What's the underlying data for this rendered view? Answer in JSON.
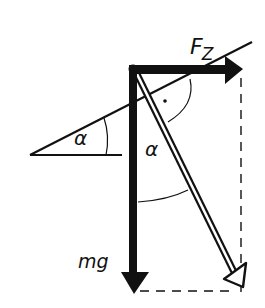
{
  "labels": {
    "centrifugal_force": "F",
    "centrifugal_force_sub": "Z",
    "weight": "mg",
    "incline_angle": "α",
    "resultant_angle": "α"
  },
  "colors": {
    "ink": "#111111",
    "background": "#ffffff"
  },
  "geometry": {
    "pivot": [
      133,
      69
    ],
    "weight_arrow_tip": [
      133,
      292
    ],
    "centrifugal_arrow_tip": [
      241,
      69
    ],
    "resultant_arrow_tip": [
      243,
      286
    ],
    "incline_line": [
      [
        30,
        155
      ],
      [
        252,
        42
      ]
    ],
    "horizontal_ref": [
      [
        30,
        155
      ],
      [
        122,
        155
      ]
    ]
  }
}
